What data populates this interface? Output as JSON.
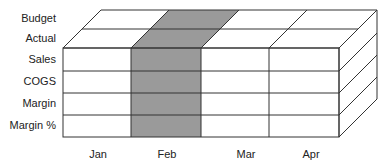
{
  "diagram": {
    "type": "olap-cube",
    "rows_top": [
      "Budget",
      "Actual"
    ],
    "rows_front": [
      "Sales",
      "COGS",
      "Margin",
      "Margin %"
    ],
    "columns": [
      "Jan",
      "Feb",
      "Mar",
      "Apr"
    ],
    "highlighted_column": "Feb",
    "colors": {
      "highlight": "#999999",
      "line": "#333333",
      "face": "#ffffff"
    }
  }
}
